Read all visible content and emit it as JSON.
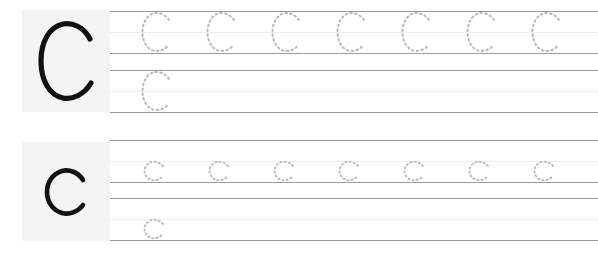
{
  "worksheet": {
    "title": "Letter C Handwriting Tracing Practice",
    "paper_color": "#ffffff",
    "model_panel_color": "#f4f4f4",
    "model_letter_color": "#111111",
    "rule_line_color": "#9a9a9e",
    "midline_color": "#ededf0",
    "trace_dot_color": "#b8b8bc"
  },
  "sections": [
    {
      "id": "uppercase",
      "case": "uppercase",
      "model_letter": "C",
      "bands": [
        {
          "id": "upper-1",
          "trace_letter": "C",
          "trace_count": 7,
          "trace_start_x": 30,
          "trace_spacing": 65
        },
        {
          "id": "upper-2",
          "trace_letter": "C",
          "trace_count": 1,
          "trace_start_x": 30,
          "trace_spacing": 65
        }
      ]
    },
    {
      "id": "lowercase",
      "case": "lowercase",
      "model_letter": "c",
      "bands": [
        {
          "id": "lower-1",
          "trace_letter": "c",
          "trace_count": 7,
          "trace_start_x": 32,
          "trace_spacing": 65
        },
        {
          "id": "lower-2",
          "trace_letter": "c",
          "trace_count": 1,
          "trace_start_x": 32,
          "trace_spacing": 65
        }
      ]
    }
  ]
}
